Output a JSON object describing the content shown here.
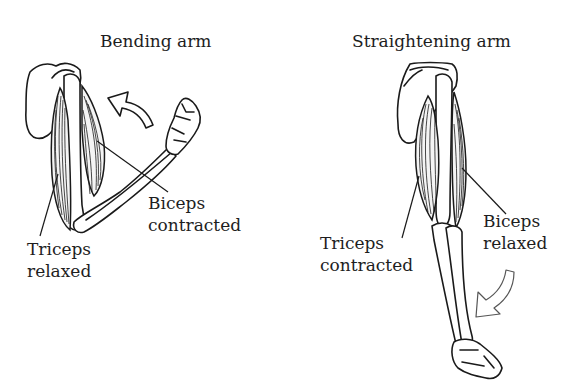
{
  "figure": {
    "panels": [
      {
        "id": "bending",
        "title": "Bending arm",
        "labels": {
          "biceps": [
            "Biceps",
            "contracted"
          ],
          "triceps": [
            "Triceps",
            "relaxed"
          ]
        },
        "arrow": "curved-up-left"
      },
      {
        "id": "straightening",
        "title": "Straightening arm",
        "labels": {
          "biceps": [
            "Biceps",
            "relaxed"
          ],
          "triceps": [
            "Triceps",
            "contracted"
          ]
        },
        "arrow": "curved-down-left"
      }
    ],
    "colors": {
      "background": "#ffffff",
      "ink": "#1a1a1a",
      "arrow_outline_light": "#555555"
    }
  }
}
